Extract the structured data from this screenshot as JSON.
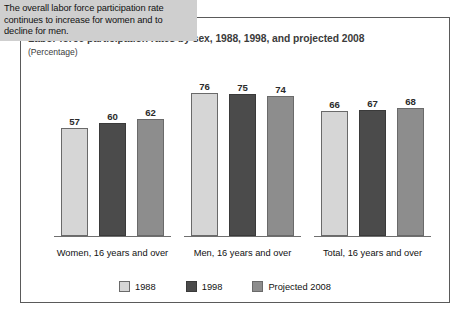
{
  "callout": {
    "text": "The overall labor force participation rate continues to increase for women and to decline for men."
  },
  "chart_data": {
    "type": "bar",
    "title": "Labor force participation rates by sex, 1988, 1998, and projected 2008",
    "subtitle": "(Percentage)",
    "xlabel": "",
    "ylabel": "",
    "ylim": [
      0,
      80
    ],
    "grid": false,
    "legend_position": "bottom-center",
    "categories": [
      "Women, 16 years and over",
      "Men, 16 years and over",
      "Total, 16 years and over"
    ],
    "series": [
      {
        "name": "1988",
        "color": "#d6d6d6",
        "values": [
          57,
          76,
          66
        ]
      },
      {
        "name": "1998",
        "color": "#4b4b4b",
        "values": [
          60,
          75,
          67
        ]
      },
      {
        "name": "Projected 2008",
        "color": "#8d8d8d",
        "values": [
          62,
          74,
          68
        ]
      }
    ]
  }
}
